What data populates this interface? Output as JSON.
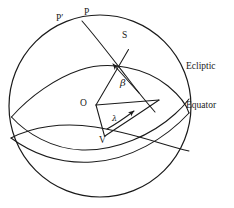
{
  "figure": {
    "kind": "celestial-sphere-diagram",
    "stroke_color": "#1a1a1a",
    "background_color": "#ffffff",
    "text_color": "#1a1a1a"
  },
  "labels": {
    "ecliptic_pole": "P′",
    "celestial_pole": "P",
    "star": "S",
    "observer": "O",
    "vernal_equinox": "V",
    "ecliptic": "Ecliptic",
    "equator": "Equator",
    "celestial_latitude": "β",
    "celestial_longitude": "λ"
  },
  "geometry": {
    "sphere": {
      "cx": 100,
      "cy": 106,
      "r": 91
    },
    "points": {
      "ecliptic_pole": {
        "x": 74,
        "y": 22
      },
      "celestial_pole": {
        "x": 96,
        "y": 16
      },
      "star": {
        "x": 127,
        "y": 45
      },
      "observer": {
        "x": 95,
        "y": 106
      },
      "vernal_equinox": {
        "x": 104,
        "y": 137
      },
      "ecliptic_foot": {
        "x": 158,
        "y": 100
      }
    }
  }
}
